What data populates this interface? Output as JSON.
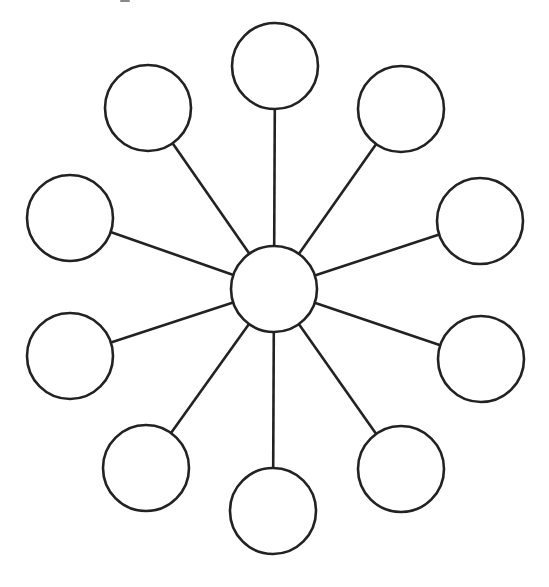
{
  "diagram": {
    "type": "hub-and-spoke",
    "stroke_color": "#222222",
    "fill_color": "#ffffff",
    "background": "#ffffff",
    "hub": {
      "id": "hub",
      "cx": 274,
      "cy": 289,
      "r": 43,
      "label": ""
    },
    "spokes": [
      {
        "id": "top",
        "cx": 275,
        "cy": 66,
        "r": 43,
        "label": ""
      },
      {
        "id": "top-right",
        "cx": 401,
        "cy": 109,
        "r": 43,
        "label": ""
      },
      {
        "id": "right-upper",
        "cx": 480,
        "cy": 221,
        "r": 43,
        "label": ""
      },
      {
        "id": "right-lower",
        "cx": 481,
        "cy": 359,
        "r": 43,
        "label": ""
      },
      {
        "id": "bottom-right",
        "cx": 401,
        "cy": 469,
        "r": 43,
        "label": ""
      },
      {
        "id": "bottom",
        "cx": 273,
        "cy": 511,
        "r": 43,
        "label": ""
      },
      {
        "id": "bottom-left",
        "cx": 146,
        "cy": 468,
        "r": 43,
        "label": ""
      },
      {
        "id": "left-lower",
        "cx": 70,
        "cy": 356,
        "r": 43,
        "label": ""
      },
      {
        "id": "left-upper",
        "cx": 70,
        "cy": 218,
        "r": 43,
        "label": ""
      },
      {
        "id": "top-left",
        "cx": 148,
        "cy": 108,
        "r": 43,
        "label": ""
      }
    ]
  }
}
